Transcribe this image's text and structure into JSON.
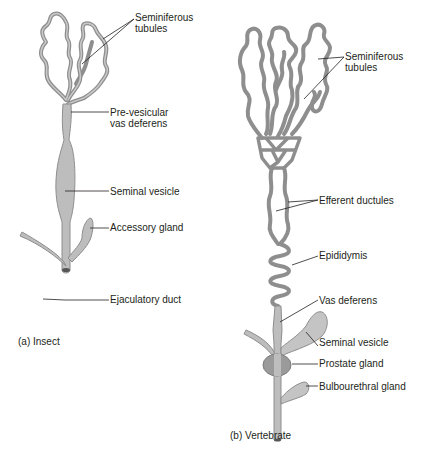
{
  "insect": {
    "caption_letter": "(a)",
    "caption_text": "Insect",
    "labels": {
      "seminiferous_1": "Seminiferous",
      "seminiferous_2": "tubules",
      "prevesicular_1": "Pre-vesicular",
      "prevesicular_2": "vas deferens",
      "seminal_vesicle": "Seminal vesicle",
      "accessory_gland": "Accessory gland",
      "ejaculatory_duct": "Ejaculatory duct"
    }
  },
  "vertebrate": {
    "caption_letter": "(b)",
    "caption_text": "Vertebrate",
    "labels": {
      "seminiferous_1": "Seminiferous",
      "seminiferous_2": "tubules",
      "efferent_ductules": "Efferent ductules",
      "epididymis": "Epididymis",
      "vas_deferens": "Vas deferens",
      "seminal_vesicle": "Seminal vesicle",
      "prostate_gland": "Prostate gland",
      "bulbourethral_gland": "Bulbourethral gland"
    }
  },
  "colors": {
    "tubule_outline": "#8e8e8e",
    "tubule_fill": "#c9c9c9",
    "organ_fill": "#bdbdbd",
    "prostate_fill": "#9a9a9a",
    "leader_line": "#231f20",
    "text": "#231f20"
  }
}
